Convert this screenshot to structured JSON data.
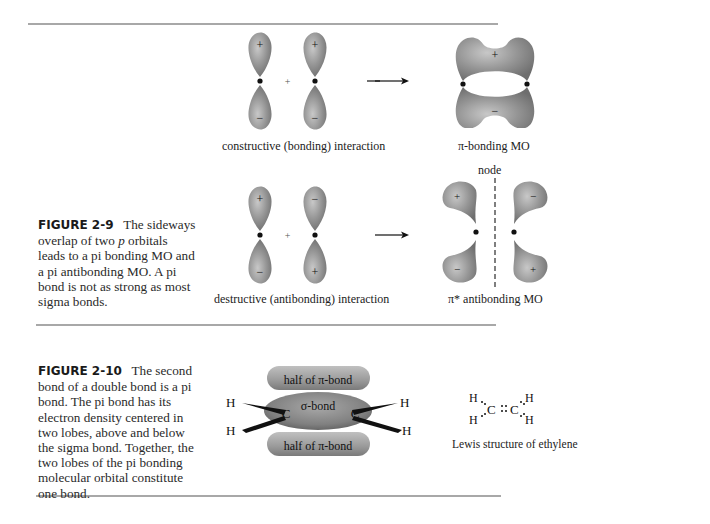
{
  "figure_2_9": {
    "number": "FIGURE 2-9",
    "caption_pre": "The sideways overlap of two ",
    "caption_italic": "p",
    "caption_post": " orbitals leads to a pi bonding MO and a pi antibonding MO. A pi bond is not as strong as most sigma bonds.",
    "top_row": {
      "left_label": "constructive (bonding) interaction",
      "right_label": "π-bonding MO",
      "plus": "+",
      "lobe_signs": [
        "+",
        "−",
        "+",
        "−"
      ],
      "mo_signs": [
        "+",
        "−"
      ]
    },
    "bottom_row": {
      "left_label": "destructive (antibonding) interaction",
      "right_label": "π* antibonding MO",
      "node_label": "node",
      "plus": "+",
      "lobe_signs": [
        "+",
        "−",
        "−",
        "+"
      ],
      "mo_signs": [
        "+",
        "−",
        "−",
        "+"
      ]
    }
  },
  "figure_2_10": {
    "number": "FIGURE 2-10",
    "caption": "The second bond of a double bond is a pi bond. The pi bond has its electron density centered in two lobes, above and below the sigma bond. Together, the two lobes of the pi bonding molecular orbital constitute one bond.",
    "diagram": {
      "top_lobe": "half of π-bond",
      "middle": "σ-bond",
      "bottom_lobe": "half of π-bond",
      "atom_c": "C",
      "atom_h": "H"
    },
    "lewis": {
      "label": "Lewis structure of ethylene",
      "structure": "H₂C::CH₂"
    }
  },
  "colors": {
    "lobe": "#8f8f8f",
    "lobe_highlight": "#c4c4c4",
    "rule": "#a8a8a8"
  }
}
